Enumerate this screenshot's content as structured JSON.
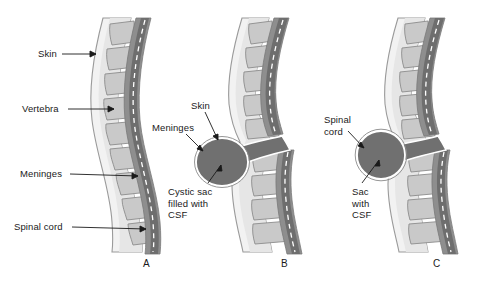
{
  "figure": {
    "background_color": "#ffffff"
  },
  "palette": {
    "skin_fill": "#f2f2f2",
    "skin_outline": "#9a9a9a",
    "subcutaneous_fill": "#e3e3e3",
    "vertebra_fill": "#c9c9c9",
    "vertebra_outline": "#8c8c8c",
    "meninges_band": "#8a8a8a",
    "canal_dark": "#6e6e6e",
    "cord_dash": "#ffffff",
    "sac_fill": "#707070",
    "sac_outline": "#ffffff",
    "leader_line": "#1a1a1a",
    "text": "#1a1a1a"
  },
  "panels": [
    {
      "id": "a",
      "letter": "A",
      "condition": "normal-spine",
      "labels": [
        {
          "name": "skin",
          "text": "Skin",
          "x": 38,
          "y": 50
        },
        {
          "name": "vertebra",
          "text": "Vertebra",
          "x": 22,
          "y": 105
        },
        {
          "name": "meninges",
          "text": "Meninges",
          "x": 20,
          "y": 170
        },
        {
          "name": "spinal-cord",
          "text": "Spinal cord",
          "x": 14,
          "y": 223
        }
      ]
    },
    {
      "id": "b",
      "letter": "B",
      "condition": "meningocele",
      "labels": [
        {
          "name": "skin",
          "text": "Skin",
          "x": 190,
          "y": 100
        },
        {
          "name": "meninges",
          "text": "Meninges",
          "x": 154,
          "y": 122
        },
        {
          "name": "cystic-sac",
          "text": "Cystic sac\nfilled with\nCSF",
          "x": 168,
          "y": 186
        }
      ]
    },
    {
      "id": "c",
      "letter": "C",
      "condition": "myelomeningocele",
      "labels": [
        {
          "name": "spinal-cord",
          "text": "Spinal\ncord",
          "x": 326,
          "y": 116
        },
        {
          "name": "sac-with-csf",
          "text": "Sac\nwith\nCSF",
          "x": 352,
          "y": 186
        }
      ]
    }
  ],
  "panel_letters": [
    {
      "text": "A",
      "x": 143,
      "y": 258
    },
    {
      "text": "B",
      "x": 281,
      "y": 258
    },
    {
      "text": "C",
      "x": 433,
      "y": 258
    }
  ]
}
